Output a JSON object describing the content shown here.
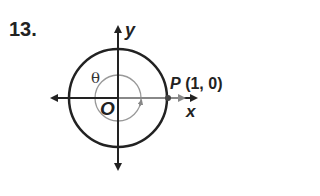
{
  "problem_number": "13.",
  "labels": {
    "y_axis": "y",
    "x_axis": "x",
    "origin": "O",
    "angle": "θ",
    "point_name": "P",
    "point_coords": "(1, 0)"
  },
  "colors": {
    "main": "#222222",
    "angle_arc": "#888888"
  }
}
